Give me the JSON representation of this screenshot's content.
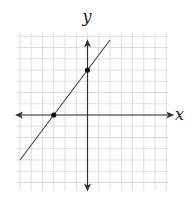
{
  "chart_data": {
    "type": "line",
    "title": "",
    "xlabel": "x",
    "ylabel": "y",
    "xlim": [
      -6,
      7
    ],
    "ylim": [
      -6,
      7
    ],
    "grid": true,
    "tick_labels": false,
    "series": [
      {
        "name": "line",
        "equation": "y = (4/3)x + 4",
        "slope": 1.3333,
        "intercept": 4,
        "x": [
          -6,
          2
        ],
        "y": [
          -4,
          6.67
        ]
      }
    ],
    "points": [
      {
        "label": "x-intercept",
        "x": -3,
        "y": 0
      },
      {
        "label": "y-intercept",
        "x": 0,
        "y": 4
      }
    ]
  },
  "labels": {
    "x_axis": "x",
    "y_axis": "y"
  },
  "colors": {
    "grid": "#d6d6d6",
    "axis": "#333333",
    "line": "#444444",
    "point": "#111111"
  }
}
